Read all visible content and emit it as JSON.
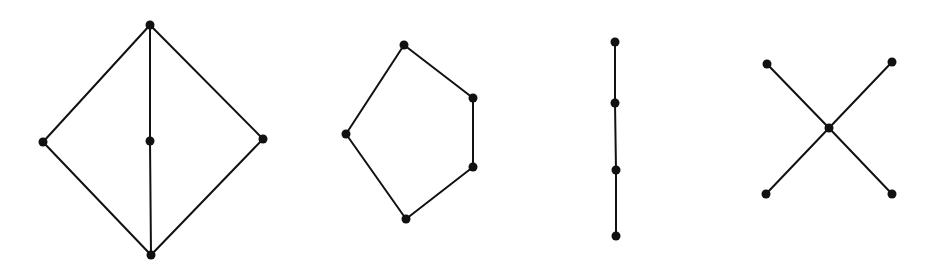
{
  "diagram": {
    "type": "graph-collection",
    "style": {
      "edge_color": "#111111",
      "node_color": "#111111",
      "background": "#ffffff",
      "node_radius": 4.5,
      "edge_width": 2
    },
    "graphs": [
      {
        "name": "diamond-with-subdivided-diagonal",
        "nodes": [
          {
            "id": "a",
            "x": 150,
            "y": 25
          },
          {
            "id": "b",
            "x": 43,
            "y": 142
          },
          {
            "id": "c",
            "x": 150,
            "y": 141
          },
          {
            "id": "d",
            "x": 263,
            "y": 139
          },
          {
            "id": "e",
            "x": 151,
            "y": 255
          }
        ],
        "edges": [
          [
            "a",
            "b"
          ],
          [
            "a",
            "d"
          ],
          [
            "a",
            "c"
          ],
          [
            "c",
            "e"
          ],
          [
            "b",
            "e"
          ],
          [
            "d",
            "e"
          ]
        ]
      },
      {
        "name": "pentagon-cycle",
        "nodes": [
          {
            "id": "a",
            "x": 404,
            "y": 45
          },
          {
            "id": "b",
            "x": 473,
            "y": 98
          },
          {
            "id": "c",
            "x": 473,
            "y": 167
          },
          {
            "id": "d",
            "x": 406,
            "y": 219
          },
          {
            "id": "e",
            "x": 346,
            "y": 134
          }
        ],
        "edges": [
          [
            "a",
            "b"
          ],
          [
            "b",
            "c"
          ],
          [
            "c",
            "d"
          ],
          [
            "d",
            "e"
          ],
          [
            "e",
            "a"
          ]
        ]
      },
      {
        "name": "path-4",
        "nodes": [
          {
            "id": "a",
            "x": 615,
            "y": 42
          },
          {
            "id": "b",
            "x": 615,
            "y": 103
          },
          {
            "id": "c",
            "x": 616,
            "y": 170
          },
          {
            "id": "d",
            "x": 616,
            "y": 236
          }
        ],
        "edges": [
          [
            "a",
            "b"
          ],
          [
            "b",
            "c"
          ],
          [
            "c",
            "d"
          ]
        ]
      },
      {
        "name": "star-4",
        "nodes": [
          {
            "id": "center",
            "x": 829,
            "y": 128
          },
          {
            "id": "tl",
            "x": 767,
            "y": 64
          },
          {
            "id": "tr",
            "x": 892,
            "y": 62
          },
          {
            "id": "bl",
            "x": 766,
            "y": 194
          },
          {
            "id": "br",
            "x": 892,
            "y": 194
          }
        ],
        "edges": [
          [
            "center",
            "tl"
          ],
          [
            "center",
            "tr"
          ],
          [
            "center",
            "bl"
          ],
          [
            "center",
            "br"
          ]
        ]
      }
    ]
  }
}
